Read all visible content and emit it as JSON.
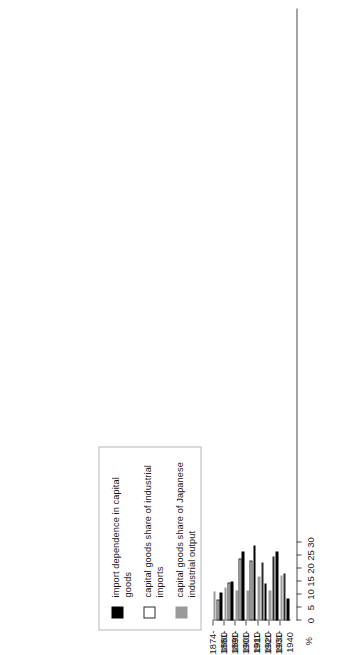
{
  "chart_data": {
    "type": "bar",
    "orientation": "horizontal",
    "title": "",
    "subtitle": "",
    "xlabel": "%",
    "ylabel": "",
    "xlim": [
      0,
      30
    ],
    "grid": false,
    "legend_position": "above-plot",
    "axis_unit_label": "%",
    "tick_labels": [
      "0",
      "5",
      "10",
      "15",
      "20",
      "25",
      "30"
    ],
    "tick_values": [
      0,
      5,
      10,
      15,
      20,
      25,
      30
    ],
    "categories": [
      "1874-\n1880",
      "1881-\n1890",
      "1891-\n1900",
      "1901-\n1910",
      "1911-\n1920",
      "1921-\n1930",
      "1931-\n1940"
    ],
    "series": [
      {
        "name": "import dependence in capital goods",
        "color": "#000000",
        "swatch": "black-swatch",
        "values": [
          10.6,
          15.0,
          26.6,
          28.9,
          14.3,
          26.4,
          8.3
        ]
      },
      {
        "name": "capital goods share of industrial imports",
        "color": "#ffffff",
        "swatch": "white-swatch",
        "values": [
          8.0,
          14.5,
          23.8,
          23.0,
          22.4,
          24.8,
          18.2
        ]
      },
      {
        "name": "capital goods share of Japanese industrial output",
        "color": "#9a9a9a",
        "swatch": "gray-swatch",
        "values": [
          11.2,
          12.6,
          11.5,
          11.4,
          17.0,
          11.6,
          17.3
        ]
      }
    ]
  },
  "legend": {
    "entries": [
      {
        "label": "import dependence in capital goods"
      },
      {
        "label": "capital goods share of industrial imports"
      },
      {
        "label": "capital goods share of Japanese industrial output"
      }
    ]
  }
}
